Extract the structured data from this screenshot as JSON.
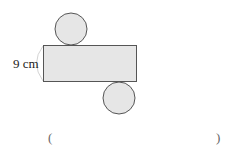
{
  "figure": {
    "height_label": "9 cm",
    "answer_open": "(",
    "answer_close": ")",
    "colors": {
      "fill": "#e6e6e6",
      "stroke": "#555555",
      "arc": "#bbbbbb"
    }
  }
}
